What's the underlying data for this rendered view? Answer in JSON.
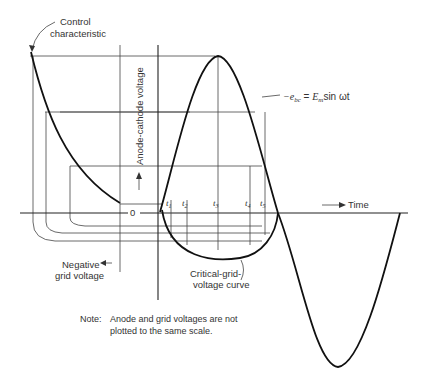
{
  "labels": {
    "control_characteristic_line1": "Control",
    "control_characteristic_line2": "characteristic",
    "y_axis": "Anode-cathode voltage",
    "origin": "0",
    "time_axis": "Time",
    "negative_grid_line1": "Negative",
    "negative_grid_line2": "grid voltage",
    "critical_curve_line1": "Critical-grid-",
    "critical_curve_line2": "voltage curve",
    "equation_lhs": "−e",
    "equation_lhs_sub": "bc",
    "equation_eq": " = ",
    "equation_rhs_E": "E",
    "equation_rhs_sub": "m",
    "equation_rhs_tail": "sin ωt",
    "note_label": "Note:",
    "note_line1": "Anode and grid voltages are not",
    "note_line2": "plotted to the same scale."
  },
  "time_markers": [
    {
      "main": "t",
      "sub": "1"
    },
    {
      "main": "t",
      "sub": "2"
    },
    {
      "main": "t",
      "sub": "3"
    },
    {
      "main": "t",
      "sub": "4"
    },
    {
      "main": "t",
      "sub": "5"
    }
  ]
}
